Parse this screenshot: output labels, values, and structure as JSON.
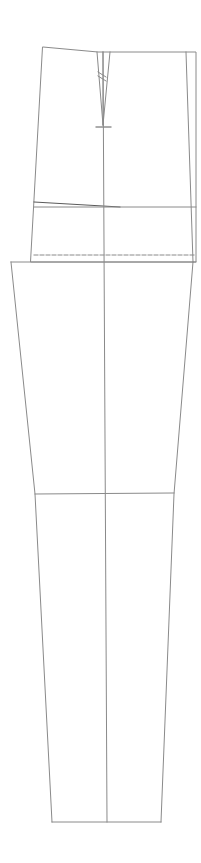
{
  "diagram": {
    "type": "trouser-pattern-draft",
    "stroke_color": "#8a8a8a",
    "dark_stroke_color": "#5a5a5a",
    "background": "#ffffff",
    "pieces": {
      "upper_block": {
        "label": "waistband-hip-block",
        "outline": [
          [
            43,
            47
          ],
          [
            98,
            52
          ],
          [
            196,
            52
          ],
          [
            196,
            262
          ],
          [
            31,
            262
          ]
        ],
        "waist_left_slope": [
          [
            43,
            47
          ],
          [
            98,
            52
          ]
        ]
      },
      "dart": {
        "left_leg": [
          [
            97,
            52
          ],
          [
            103,
            125
          ]
        ],
        "right_leg": [
          [
            110,
            52
          ],
          [
            103,
            125
          ]
        ],
        "center": [
          [
            103,
            52
          ],
          [
            103,
            125
          ]
        ],
        "end_tick": [
          [
            96,
            127
          ],
          [
            111,
            127
          ]
        ],
        "hatch_marks": [
          [
            [
              98,
              72
            ],
            [
              106,
              77
            ]
          ],
          [
            [
              98,
              76
            ],
            [
              106,
              81
            ]
          ]
        ]
      },
      "side_seam_line": [
        [
          186,
          52
        ],
        [
          193,
          262
        ]
      ],
      "hip_lines": {
        "slanted": [
          [
            34,
            202
          ],
          [
            120,
            207
          ]
        ],
        "horizontal": [
          [
            34,
            207
          ],
          [
            196,
            207
          ]
        ]
      },
      "crotch_dashed_line": [
        [
          34,
          255
        ],
        [
          196,
          255
        ]
      ],
      "leg_block": {
        "label": "leg-block",
        "top_line": [
          [
            11,
            262
          ],
          [
            196,
            262
          ]
        ],
        "left_edge": [
          [
            11,
            262
          ],
          [
            35,
            494
          ],
          [
            52,
            822
          ]
        ],
        "right_edge": [
          [
            193,
            262
          ],
          [
            174,
            494
          ],
          [
            161,
            822
          ]
        ],
        "knee_line": [
          [
            35,
            494
          ],
          [
            174,
            493
          ]
        ],
        "hem_line": [
          [
            52,
            822
          ],
          [
            161,
            822
          ]
        ]
      },
      "grain_line": [
        [
          103,
          52
        ],
        [
          107,
          822
        ]
      ]
    }
  }
}
